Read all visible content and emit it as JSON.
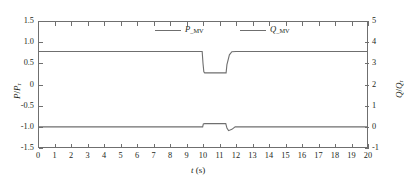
{
  "chart_data": {
    "type": "line",
    "title": "",
    "xlabel": "t (s)",
    "ylabel": "P/P_r",
    "ylabel_right": "Q/Q_r",
    "xlim": [
      0,
      20
    ],
    "ylim": [
      -1.5,
      1.5
    ],
    "ylim_right": [
      -1,
      5
    ],
    "grid": false,
    "legend_position": "top-center",
    "x_ticks": [
      "0",
      "1",
      "2",
      "3",
      "4",
      "5",
      "6",
      "7",
      "8",
      "9",
      "10",
      "11",
      "12",
      "13",
      "14",
      "15",
      "16",
      "17",
      "18",
      "19",
      "20"
    ],
    "y_ticks_left": [
      "1.5",
      "1.0",
      "0.5",
      "0",
      "-0.5",
      "-1.0",
      "-1.5"
    ],
    "y_ticks_right": [
      "5",
      "4",
      "3",
      "2",
      "1",
      "0",
      "-1"
    ],
    "series": [
      {
        "name": "P_MV",
        "name_base": "P",
        "name_sub": "MV",
        "color": "#6f6f6f",
        "axis": "left",
        "x": [
          0,
          9.95,
          10.0,
          10.05,
          10.1,
          11.4,
          11.45,
          11.6,
          11.75,
          12.0,
          20
        ],
        "y": [
          0.78,
          0.78,
          0.5,
          0.3,
          0.275,
          0.275,
          0.47,
          0.7,
          0.775,
          0.78,
          0.78
        ]
      },
      {
        "name": "Q_MV",
        "name_base": "Q",
        "name_sub": "MV",
        "color": "#6f6f6f",
        "axis": "left",
        "x": [
          0,
          9.98,
          10.02,
          10.1,
          11.38,
          11.45,
          11.55,
          11.75,
          11.95,
          12.2,
          20
        ],
        "y": [
          -1.0,
          -1.0,
          -0.93,
          -0.925,
          -0.925,
          -1.03,
          -1.09,
          -1.06,
          -1.0,
          -1.0,
          -1.0
        ]
      }
    ]
  },
  "axes": {
    "left_title_base": "P",
    "left_title_sub": "r",
    "right_title_base": "Q",
    "right_title_sub": "r",
    "x_title_base": "t",
    "x_title_unit": "(s)"
  }
}
